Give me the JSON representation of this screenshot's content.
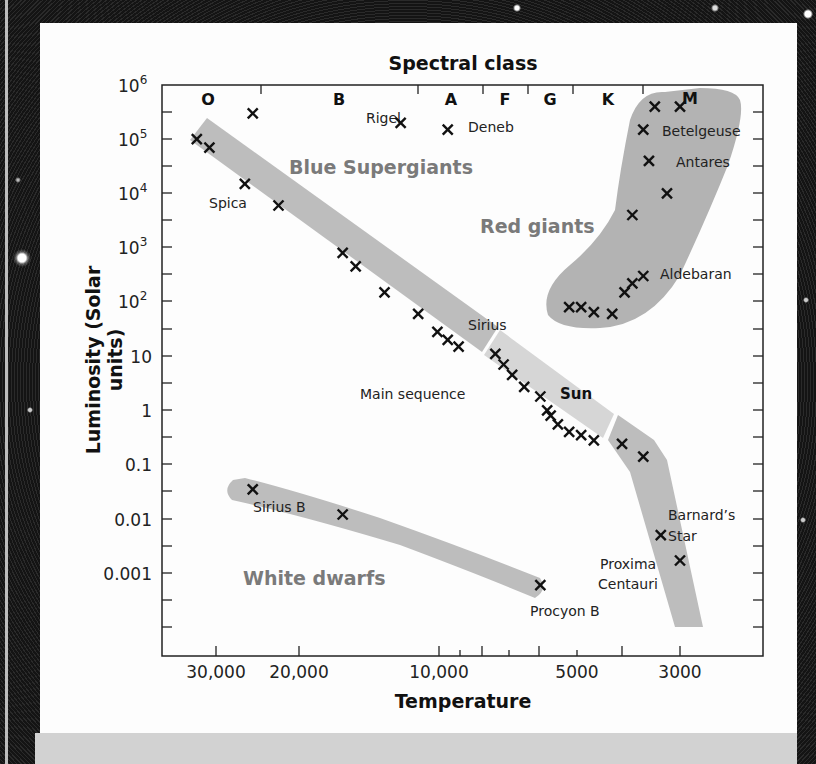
{
  "chart_data": {
    "type": "scatter",
    "top_axis_title": "Spectral class",
    "xlabel": "Temperature",
    "ylabel": "Luminosity (Solar units)",
    "x_scale": "log-reversed",
    "y_scale": "log",
    "xlim": [
      40000,
      2300
    ],
    "ylim": [
      3e-05,
      1000000
    ],
    "x_ticks": [
      "30,000",
      "20,000",
      "10,000",
      "5000",
      "3000"
    ],
    "y_ticks": [
      "10^6",
      "10^5",
      "10^4",
      "10^3",
      "10^2",
      "10",
      "1",
      "0.1",
      "0.01",
      "0.001"
    ],
    "spectral_classes": [
      "O",
      "B",
      "A",
      "F",
      "G",
      "K",
      "M"
    ],
    "regions": [
      {
        "name": "Blue Supergiants",
        "color": "#bdbdbd"
      },
      {
        "name": "Red giants",
        "color": "#b3b3b3"
      },
      {
        "name": "Main sequence",
        "color": "#c8c8c8"
      },
      {
        "name": "White dwarfs",
        "color": "#bdbdbd"
      }
    ],
    "series": [
      {
        "name": "Main sequence stars",
        "points": [
          {
            "T": 33000,
            "L": 100000
          },
          {
            "T": 31000,
            "L": 70000
          },
          {
            "T": 26000,
            "L": 15000,
            "label": "Spica"
          },
          {
            "T": 22000,
            "L": 6000
          },
          {
            "T": 16000,
            "L": 800
          },
          {
            "T": 15000,
            "L": 450
          },
          {
            "T": 13000,
            "L": 150
          },
          {
            "T": 11000,
            "L": 60
          },
          {
            "T": 10000,
            "L": 28
          },
          {
            "T": 9500,
            "L": 20
          },
          {
            "T": 9000,
            "L": 15,
            "label": "Sirius"
          },
          {
            "T": 7500,
            "L": 11
          },
          {
            "T": 7200,
            "L": 7
          },
          {
            "T": 6900,
            "L": 4.5
          },
          {
            "T": 6500,
            "L": 2.7
          },
          {
            "T": 6000,
            "L": 1.8
          },
          {
            "T": 5800,
            "L": 1,
            "label": "Sun"
          },
          {
            "T": 5700,
            "L": 0.8
          },
          {
            "T": 5500,
            "L": 0.55
          },
          {
            "T": 5200,
            "L": 0.4
          },
          {
            "T": 4900,
            "L": 0.35
          },
          {
            "T": 4600,
            "L": 0.28
          },
          {
            "T": 4000,
            "L": 0.24
          },
          {
            "T": 3600,
            "L": 0.14
          },
          {
            "T": 3300,
            "L": 0.005,
            "label": "Barnard's Star"
          },
          {
            "T": 3000,
            "L": 0.0017,
            "label": "Proxima Centauri"
          }
        ]
      },
      {
        "name": "Supergiants",
        "points": [
          {
            "T": 25000,
            "L": 300000
          },
          {
            "T": 12000,
            "L": 200000,
            "label": "Rigel"
          },
          {
            "T": 9500,
            "L": 150000,
            "label": "Deneb"
          }
        ]
      },
      {
        "name": "Red giants",
        "points": [
          {
            "T": 3400,
            "L": 400000
          },
          {
            "T": 3000,
            "L": 400000
          },
          {
            "T": 3600,
            "L": 150000,
            "label": "Betelgeuse"
          },
          {
            "T": 3500,
            "L": 40000,
            "label": "Antares"
          },
          {
            "T": 3200,
            "L": 10000
          },
          {
            "T": 3800,
            "L": 4000
          },
          {
            "T": 3600,
            "L": 300,
            "label": "Aldebaran"
          },
          {
            "T": 3800,
            "L": 220
          },
          {
            "T": 3950,
            "L": 150
          },
          {
            "T": 5200,
            "L": 80
          },
          {
            "T": 4900,
            "L": 80
          },
          {
            "T": 4600,
            "L": 65
          },
          {
            "T": 4200,
            "L": 60
          }
        ]
      },
      {
        "name": "White dwarfs",
        "points": [
          {
            "T": 25000,
            "L": 0.035,
            "label": "Sirius B"
          },
          {
            "T": 16000,
            "L": 0.012
          },
          {
            "T": 6000,
            "L": 0.0006,
            "label": "Procyon B"
          }
        ]
      }
    ]
  },
  "labels": {
    "top_title": "Spectral class",
    "x_title": "Temperature",
    "y_title_line1": "Luminosity (Solar",
    "y_title_line2": "units)",
    "classes": {
      "O": "O",
      "B": "B",
      "A": "A",
      "F": "F",
      "G": "G",
      "K": "K",
      "M": "M"
    },
    "x_ticks": {
      "t30000": "30,000",
      "t20000": "20,000",
      "t10000": "10,000",
      "t5000": "5000",
      "t3000": "3000"
    },
    "y_ticks": {
      "e6b": "10",
      "e6s": "6",
      "e5b": "10",
      "e5s": "5",
      "e4b": "10",
      "e4s": "4",
      "e3b": "10",
      "e3s": "3",
      "e2b": "10",
      "e2s": "2",
      "ten": "10",
      "one": "1",
      "tenth": "0.1",
      "hundredth": "0.01",
      "thousandth": "0.001"
    },
    "regions": {
      "blue": "Blue Supergiants",
      "red": "Red giants",
      "main": "Main sequence",
      "white": "White dwarfs"
    },
    "stars": {
      "spica": "Spica",
      "rigel": "Rigel",
      "deneb": "Deneb",
      "sirius": "Sirius",
      "sun": "Sun",
      "betelgeuse": "Betelgeuse",
      "antares": "Antares",
      "aldebaran": "Aldebaran",
      "barnard1": "Barnard’s",
      "barnard2": "Star",
      "proxima1": "Proxima",
      "proxima2": "Centauri",
      "siriusb": "Sirius B",
      "procyonb": "Procyon B"
    }
  }
}
